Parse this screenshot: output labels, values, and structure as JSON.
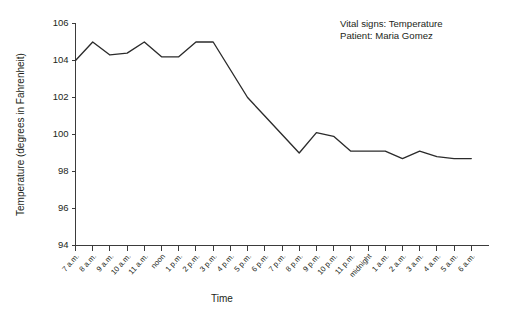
{
  "chart_data": {
    "type": "line",
    "title": "",
    "xlabel": "Time",
    "ylabel": "Temperature (degrees in Fahrenheit)",
    "ylim": [
      94,
      106
    ],
    "yticks": [
      94,
      96,
      98,
      100,
      102,
      104,
      106
    ],
    "grid": false,
    "legend": false,
    "categories": [
      "7 a.m.",
      "8 a.m.",
      "9 a.m.",
      "10 a.m.",
      "11 a.m.",
      "noon",
      "1 p.m.",
      "2 p.m.",
      "3 p.m.",
      "4 p.m.",
      "5 p.m.",
      "6 p.m.",
      "7 p.m.",
      "8 p.m.",
      "9 p.m.",
      "10 p.m.",
      "11 p.m.",
      "midnight",
      "1 a.m.",
      "2 a.m.",
      "3 a.m.",
      "4 a.m.",
      "5 a.m.",
      "6 a.m."
    ],
    "values": [
      104.0,
      105.0,
      104.3,
      104.4,
      105.0,
      104.2,
      104.2,
      105.0,
      105.0,
      103.5,
      102.0,
      101.0,
      100.0,
      99.0,
      100.1,
      99.9,
      99.1,
      99.1,
      99.1,
      98.7,
      99.1,
      98.8,
      98.7,
      98.7
    ],
    "series_name": "Temperature",
    "annotations": [
      "Vital signs: Temperature",
      "Patient: Maria Gomez"
    ]
  }
}
